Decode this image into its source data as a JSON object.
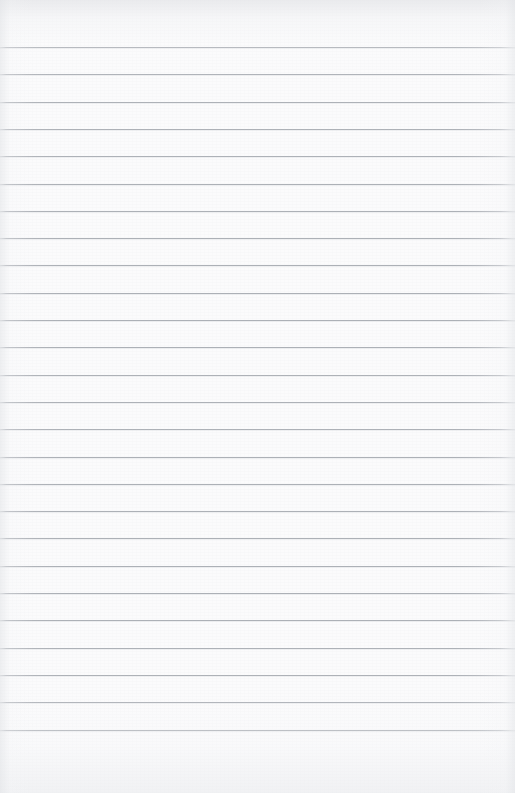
{
  "document": {
    "kind": "scanned-ruled-paper",
    "title": "Blank lined notebook page",
    "text_content": "",
    "handwriting": "",
    "page_width": 515,
    "page_height": 793
  },
  "paper": {
    "background_color": "#fbfbfc",
    "paper_tone": "#f7f8f9",
    "scan_edge_tone": "#e4e5e8",
    "has_visible_text": false,
    "has_vertical_margin_rule": false,
    "has_holes": false,
    "orientation": "portrait"
  },
  "ruling": {
    "line_color": "#acb0b6",
    "line_thickness_px": 1,
    "line_spacing_px": 27.3,
    "first_line_y": 47,
    "last_line_y": 739,
    "line_count": 26,
    "top_margin_px": 47,
    "bottom_margin_px": 54,
    "left_inset_px": 0,
    "right_inset_px": 0,
    "full_bleed": true,
    "line_y_positions": [
      47,
      74.3,
      101.6,
      128.9,
      156.2,
      183.5,
      210.8,
      238.1,
      265.4,
      292.7,
      320,
      347.3,
      374.6,
      401.9,
      429.2,
      456.5,
      483.8,
      511.1,
      538.4,
      565.7,
      593,
      620.3,
      647.6,
      674.9,
      702.2,
      729.5
    ]
  }
}
